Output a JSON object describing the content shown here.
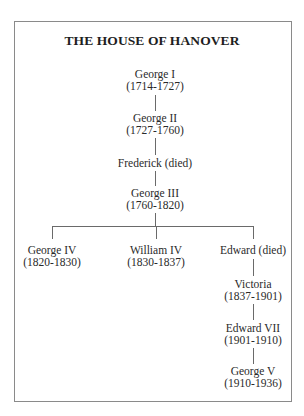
{
  "diagram": {
    "title": "THE HOUSE OF HANOVER",
    "type": "family-tree",
    "nodes": [
      {
        "id": "george1",
        "name": "George I",
        "reign": "(1714-1727)"
      },
      {
        "id": "george2",
        "name": "George II",
        "reign": "(1727-1760)"
      },
      {
        "id": "frederick",
        "name": "Frederick (died)",
        "reign": ""
      },
      {
        "id": "george3",
        "name": "George III",
        "reign": "(1760-1820)"
      },
      {
        "id": "george4",
        "name": "George IV",
        "reign": "(1820-1830)"
      },
      {
        "id": "william4",
        "name": "William IV",
        "reign": "(1830-1837)"
      },
      {
        "id": "edward",
        "name": "Edward (died)",
        "reign": ""
      },
      {
        "id": "victoria",
        "name": "Victoria",
        "reign": "(1837-1901)"
      },
      {
        "id": "edward7",
        "name": "Edward VII",
        "reign": "(1901-1910)"
      },
      {
        "id": "george5",
        "name": "George V",
        "reign": "(1910-1936)"
      }
    ],
    "edges": [
      [
        "george1",
        "george2"
      ],
      [
        "george2",
        "frederick"
      ],
      [
        "frederick",
        "george3"
      ],
      [
        "george3",
        "george4"
      ],
      [
        "george3",
        "william4"
      ],
      [
        "george3",
        "edward"
      ],
      [
        "edward",
        "victoria"
      ],
      [
        "victoria",
        "edward7"
      ],
      [
        "edward7",
        "george5"
      ]
    ]
  }
}
